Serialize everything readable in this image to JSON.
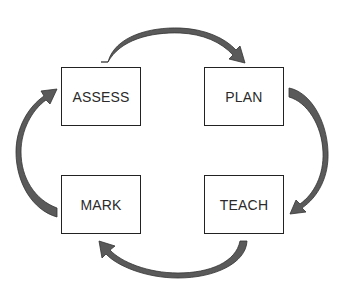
{
  "diagram": {
    "type": "cycle",
    "nodes": [
      {
        "id": "assess",
        "label": "ASSESS"
      },
      {
        "id": "plan",
        "label": "PLAN"
      },
      {
        "id": "teach",
        "label": "TEACH"
      },
      {
        "id": "mark",
        "label": "MARK"
      }
    ],
    "edges": [
      {
        "from": "assess",
        "to": "plan"
      },
      {
        "from": "plan",
        "to": "teach"
      },
      {
        "from": "teach",
        "to": "mark"
      },
      {
        "from": "mark",
        "to": "assess"
      }
    ],
    "colors": {
      "arrow_fill": "#5a5a5a",
      "arrow_stroke": "#333333",
      "box_border": "#222222",
      "text": "#2a2a2a"
    }
  }
}
